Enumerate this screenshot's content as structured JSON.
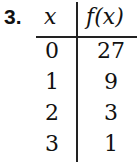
{
  "problem_number": "3.",
  "table": {
    "headers": [
      "x",
      "f(x)"
    ],
    "rows": [
      {
        "x": "0",
        "fx": "27"
      },
      {
        "x": "1",
        "fx": "9"
      },
      {
        "x": "2",
        "fx": "3"
      },
      {
        "x": "3",
        "fx": "1"
      }
    ]
  }
}
